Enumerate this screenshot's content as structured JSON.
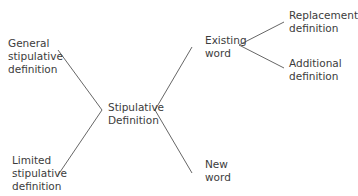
{
  "diagram": {
    "root": {
      "line1": "Stipulative",
      "line2": "Definition"
    },
    "left_branches": [
      {
        "line1": "General",
        "line2": "stipulative",
        "line3": "definition"
      },
      {
        "line1": "Limited",
        "line2": "stipulative",
        "line3": "definition"
      }
    ],
    "right_branches": [
      {
        "line1": "Existing",
        "line2": "word"
      },
      {
        "line1": "New",
        "line2": "word"
      }
    ],
    "existing_word_children": [
      {
        "line1": "Replacement",
        "line2": "definition"
      },
      {
        "line1": "Additional",
        "line2": "definition"
      }
    ],
    "colors": {
      "line": "#555555",
      "text": "#3c3c3c",
      "background": "#ffffff"
    }
  }
}
